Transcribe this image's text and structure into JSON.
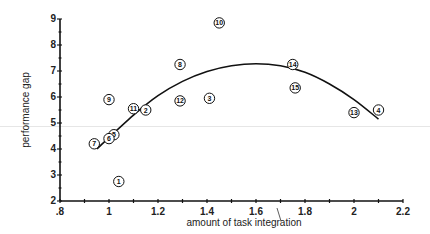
{
  "chart_data": {
    "type": "scatter",
    "title": "",
    "xlabel": "amount of task integration",
    "ylabel": "performance gap",
    "xlim": [
      0.8,
      2.2
    ],
    "ylim": [
      2,
      9
    ],
    "x_ticks": [
      0.8,
      1.0,
      1.2,
      1.4,
      1.6,
      1.8,
      2.0,
      2.2
    ],
    "x_tick_labels": [
      ".8",
      "1",
      "1.2",
      "1.4",
      "1.6",
      "1.8",
      "2",
      "2.2"
    ],
    "x_minor_step": 0.1,
    "y_ticks": [
      2,
      3,
      4,
      5,
      6,
      7,
      8,
      9
    ],
    "y_tick_labels": [
      "2",
      "3",
      "4",
      "5",
      "6",
      "7",
      "8",
      "9"
    ],
    "grid": false,
    "legend": "none",
    "points": [
      {
        "label": "1",
        "x": 1.04,
        "y": 2.75
      },
      {
        "label": "2",
        "x": 1.15,
        "y": 5.5
      },
      {
        "label": "3",
        "x": 1.41,
        "y": 5.95
      },
      {
        "label": "4",
        "x": 2.1,
        "y": 5.5
      },
      {
        "label": "5",
        "x": 1.02,
        "y": 4.55
      },
      {
        "label": "6",
        "x": 1.0,
        "y": 4.4
      },
      {
        "label": "7",
        "x": 0.94,
        "y": 4.2
      },
      {
        "label": "8",
        "x": 1.29,
        "y": 7.25
      },
      {
        "label": "9",
        "x": 1.0,
        "y": 5.9
      },
      {
        "label": "10",
        "x": 1.45,
        "y": 8.85
      },
      {
        "label": "11",
        "x": 1.1,
        "y": 5.55
      },
      {
        "label": "12",
        "x": 1.29,
        "y": 5.85
      },
      {
        "label": "13",
        "x": 2.0,
        "y": 5.4
      },
      {
        "label": "14",
        "x": 1.75,
        "y": 7.25
      },
      {
        "label": "15",
        "x": 1.76,
        "y": 6.35
      }
    ],
    "fit_curve": {
      "type": "quadratic",
      "x": [
        0.95,
        1.1,
        1.2,
        1.3,
        1.4,
        1.5,
        1.6,
        1.7,
        1.8,
        1.9,
        2.0,
        2.1
      ],
      "y": [
        4.0,
        5.3,
        6.05,
        6.6,
        6.98,
        7.2,
        7.28,
        7.2,
        6.95,
        6.5,
        5.9,
        5.15
      ]
    }
  }
}
